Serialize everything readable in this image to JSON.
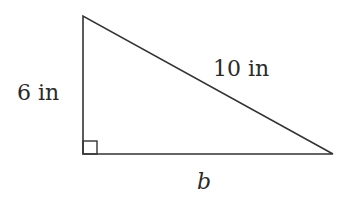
{
  "figure": {
    "type": "right-triangle",
    "labels": {
      "left_side": "6 in",
      "hypotenuse": "10 in",
      "base": "b"
    },
    "right_angle_marker": true,
    "stroke_color": "#333333"
  }
}
